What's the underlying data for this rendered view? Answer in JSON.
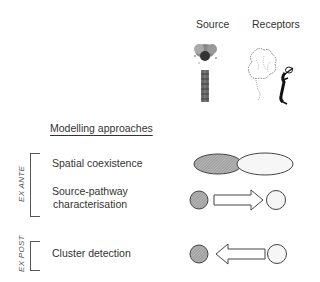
{
  "header": {
    "source_label": "Source",
    "receptors_label": "Receptors"
  },
  "section_title": "Modelling approaches",
  "groups": [
    {
      "label": "EX ANTE",
      "items": [
        "Spatial coexistence",
        "Source-pathway characterisation"
      ]
    },
    {
      "label": "EX POST",
      "items": [
        "Cluster detection"
      ]
    }
  ],
  "rows": [
    {
      "label_line1": "Spatial coexistence",
      "label_line2": "",
      "symbol": "overlapping-ellipses"
    },
    {
      "label_line1": "Source-pathway",
      "label_line2": "characterisation",
      "symbol": "arrow-source-to-receptor"
    },
    {
      "label_line1": "Cluster detection",
      "label_line2": "",
      "symbol": "arrow-receptor-to-source"
    }
  ],
  "colors": {
    "source_fill": "#9a9a9a",
    "receptor_fill": "#f4f4f4",
    "stroke": "#444444"
  },
  "icons": {
    "source": "smokestack-icon",
    "receptors": "people-icon"
  }
}
